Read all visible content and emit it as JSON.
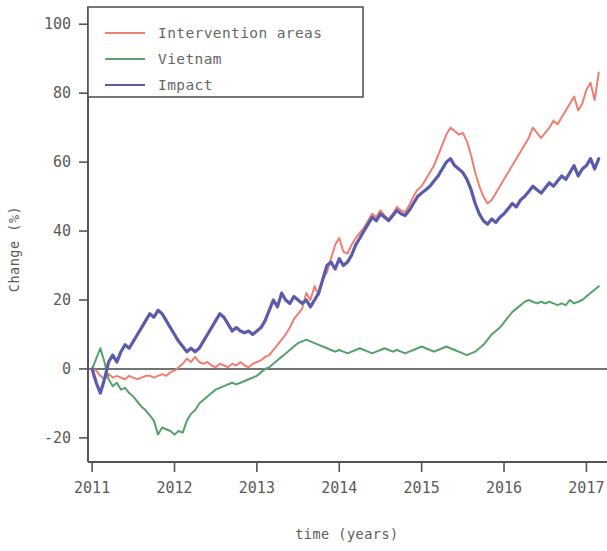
{
  "chart_data": {
    "type": "line",
    "title": "",
    "xlabel": "time (years)",
    "ylabel": "Change (%)",
    "xlim": [
      2010.95,
      2017.25
    ],
    "ylim": [
      -27,
      105
    ],
    "xticks": [
      2011,
      2012,
      2013,
      2014,
      2015,
      2016,
      2017
    ],
    "xtick_labels": [
      "2011",
      "2012",
      "2013",
      "2014",
      "2015",
      "2016",
      "2017"
    ],
    "yticks": [
      -20,
      0,
      20,
      40,
      60,
      80,
      100
    ],
    "ytick_labels": [
      "-20",
      "0",
      "20",
      "40",
      "60",
      "80",
      "100"
    ],
    "grid": false,
    "legend_position": "upper left",
    "zero_line": 0,
    "series": [
      {
        "name": "Intervention areas",
        "color": "#ee7f72",
        "linewidth": 2.0,
        "x": [
          2011.0,
          2011.05,
          2011.1,
          2011.15,
          2011.2,
          2011.25,
          2011.3,
          2011.35,
          2011.4,
          2011.45,
          2011.5,
          2011.55,
          2011.6,
          2011.65,
          2011.7,
          2011.75,
          2011.8,
          2011.85,
          2011.9,
          2011.95,
          2012.0,
          2012.05,
          2012.1,
          2012.15,
          2012.2,
          2012.25,
          2012.3,
          2012.35,
          2012.4,
          2012.45,
          2012.5,
          2012.55,
          2012.6,
          2012.65,
          2012.7,
          2012.75,
          2012.8,
          2012.85,
          2012.9,
          2012.95,
          2013.0,
          2013.05,
          2013.1,
          2013.15,
          2013.2,
          2013.25,
          2013.3,
          2013.35,
          2013.4,
          2013.45,
          2013.5,
          2013.55,
          2013.6,
          2013.65,
          2013.7,
          2013.75,
          2013.8,
          2013.85,
          2013.9,
          2013.95,
          2014.0,
          2014.05,
          2014.1,
          2014.15,
          2014.2,
          2014.25,
          2014.3,
          2014.35,
          2014.4,
          2014.45,
          2014.5,
          2014.55,
          2014.6,
          2014.65,
          2014.7,
          2014.75,
          2014.8,
          2014.85,
          2014.9,
          2014.95,
          2015.0,
          2015.05,
          2015.1,
          2015.15,
          2015.2,
          2015.25,
          2015.3,
          2015.35,
          2015.4,
          2015.45,
          2015.5,
          2015.55,
          2015.6,
          2015.65,
          2015.7,
          2015.75,
          2015.8,
          2015.85,
          2015.9,
          2015.95,
          2016.0,
          2016.05,
          2016.1,
          2016.15,
          2016.2,
          2016.25,
          2016.3,
          2016.35,
          2016.4,
          2016.45,
          2016.5,
          2016.55,
          2016.6,
          2016.65,
          2016.7,
          2016.75,
          2016.8,
          2016.85,
          2016.9,
          2016.95,
          2017.0,
          2017.05,
          2017.1,
          2017.15
        ],
        "y": [
          0.0,
          -0.5,
          -2.0,
          -3.0,
          -1.5,
          -2.5,
          -2.0,
          -2.5,
          -3.0,
          -2.0,
          -2.5,
          -3.0,
          -2.5,
          -2.0,
          -2.0,
          -2.5,
          -2.0,
          -1.5,
          -2.0,
          -1.0,
          -0.5,
          0.5,
          1.5,
          3.0,
          2.0,
          3.5,
          2.0,
          1.5,
          2.0,
          1.0,
          0.5,
          1.5,
          1.0,
          0.5,
          1.5,
          1.0,
          2.0,
          1.0,
          0.5,
          1.5,
          2.0,
          2.5,
          3.5,
          4.0,
          5.5,
          7.0,
          8.5,
          10.0,
          12.0,
          14.5,
          16.0,
          17.5,
          22.0,
          20.0,
          24.0,
          21.5,
          26.0,
          28.0,
          32.0,
          36.0,
          38.0,
          34.0,
          33.5,
          36.0,
          38.0,
          39.5,
          41.0,
          43.0,
          45.0,
          44.0,
          46.0,
          44.5,
          43.5,
          45.0,
          47.0,
          46.0,
          45.5,
          47.5,
          50.0,
          52.0,
          53.0,
          55.0,
          57.0,
          59.0,
          62.0,
          65.0,
          68.0,
          70.0,
          69.0,
          68.0,
          68.5,
          66.0,
          62.0,
          57.0,
          53.0,
          50.0,
          48.0,
          49.0,
          51.0,
          53.0,
          55.0,
          57.0,
          59.0,
          61.0,
          63.0,
          65.0,
          67.0,
          70.0,
          68.5,
          67.0,
          68.5,
          70.0,
          72.0,
          71.0,
          73.0,
          75.0,
          77.0,
          79.0,
          75.0,
          77.0,
          81.0,
          83.0,
          78.0,
          86.0
        ]
      },
      {
        "name": "Vietnam",
        "color": "#56a06a",
        "linewidth": 2.0,
        "x": [
          2011.0,
          2011.05,
          2011.1,
          2011.15,
          2011.2,
          2011.25,
          2011.3,
          2011.35,
          2011.4,
          2011.45,
          2011.5,
          2011.55,
          2011.6,
          2011.65,
          2011.7,
          2011.75,
          2011.8,
          2011.85,
          2011.9,
          2011.95,
          2012.0,
          2012.05,
          2012.1,
          2012.15,
          2012.2,
          2012.25,
          2012.3,
          2012.35,
          2012.4,
          2012.45,
          2012.5,
          2012.55,
          2012.6,
          2012.65,
          2012.7,
          2012.75,
          2012.8,
          2012.85,
          2012.9,
          2012.95,
          2013.0,
          2013.05,
          2013.1,
          2013.15,
          2013.2,
          2013.25,
          2013.3,
          2013.35,
          2013.4,
          2013.45,
          2013.5,
          2013.55,
          2013.6,
          2013.65,
          2013.7,
          2013.75,
          2013.8,
          2013.85,
          2013.9,
          2013.95,
          2014.0,
          2014.05,
          2014.1,
          2014.15,
          2014.2,
          2014.25,
          2014.3,
          2014.35,
          2014.4,
          2014.45,
          2014.5,
          2014.55,
          2014.6,
          2014.65,
          2014.7,
          2014.75,
          2014.8,
          2014.85,
          2014.9,
          2014.95,
          2015.0,
          2015.05,
          2015.1,
          2015.15,
          2015.2,
          2015.25,
          2015.3,
          2015.35,
          2015.4,
          2015.45,
          2015.5,
          2015.55,
          2015.6,
          2015.65,
          2015.7,
          2015.75,
          2015.8,
          2015.85,
          2015.9,
          2015.95,
          2016.0,
          2016.05,
          2016.1,
          2016.15,
          2016.2,
          2016.25,
          2016.3,
          2016.35,
          2016.4,
          2016.45,
          2016.5,
          2016.55,
          2016.6,
          2016.65,
          2016.7,
          2016.75,
          2016.8,
          2016.85,
          2016.9,
          2016.95,
          2017.0,
          2017.05,
          2017.1,
          2017.15
        ],
        "y": [
          0.0,
          3.0,
          6.0,
          2.0,
          -3.0,
          -5.0,
          -4.0,
          -6.0,
          -5.5,
          -7.0,
          -8.0,
          -9.5,
          -11.0,
          -12.0,
          -13.5,
          -15.0,
          -19.0,
          -17.0,
          -17.5,
          -18.0,
          -19.0,
          -18.0,
          -18.5,
          -15.0,
          -13.0,
          -12.0,
          -10.0,
          -9.0,
          -8.0,
          -7.0,
          -6.0,
          -5.5,
          -5.0,
          -4.5,
          -4.0,
          -4.5,
          -4.0,
          -3.5,
          -3.0,
          -2.5,
          -2.0,
          -1.0,
          0.0,
          0.5,
          1.5,
          2.5,
          3.5,
          4.5,
          5.5,
          6.5,
          7.5,
          8.0,
          8.5,
          8.0,
          7.5,
          7.0,
          6.5,
          6.0,
          5.5,
          5.0,
          5.5,
          5.0,
          4.5,
          5.0,
          5.5,
          6.0,
          5.5,
          5.0,
          4.5,
          5.0,
          5.5,
          6.0,
          5.5,
          5.0,
          5.5,
          5.0,
          4.5,
          5.0,
          5.5,
          6.0,
          6.5,
          6.0,
          5.5,
          5.0,
          5.5,
          6.0,
          6.5,
          6.0,
          5.5,
          5.0,
          4.5,
          4.0,
          4.5,
          5.0,
          6.0,
          7.0,
          8.5,
          10.0,
          11.0,
          12.0,
          13.5,
          15.0,
          16.5,
          17.5,
          18.5,
          19.5,
          20.0,
          19.5,
          19.0,
          19.5,
          19.0,
          19.5,
          19.0,
          18.5,
          19.0,
          18.5,
          20.0,
          19.0,
          19.5,
          20.0,
          21.0,
          22.0,
          23.0,
          24.0
        ]
      },
      {
        "name": "Impact",
        "color": "#5b5bae",
        "linewidth": 3.2,
        "x": [
          2011.0,
          2011.05,
          2011.1,
          2011.15,
          2011.2,
          2011.25,
          2011.3,
          2011.35,
          2011.4,
          2011.45,
          2011.5,
          2011.55,
          2011.6,
          2011.65,
          2011.7,
          2011.75,
          2011.8,
          2011.85,
          2011.9,
          2011.95,
          2012.0,
          2012.05,
          2012.1,
          2012.15,
          2012.2,
          2012.25,
          2012.3,
          2012.35,
          2012.4,
          2012.45,
          2012.5,
          2012.55,
          2012.6,
          2012.65,
          2012.7,
          2012.75,
          2012.8,
          2012.85,
          2012.9,
          2012.95,
          2013.0,
          2013.05,
          2013.1,
          2013.15,
          2013.2,
          2013.25,
          2013.3,
          2013.35,
          2013.4,
          2013.45,
          2013.5,
          2013.55,
          2013.6,
          2013.65,
          2013.7,
          2013.75,
          2013.8,
          2013.85,
          2013.9,
          2013.95,
          2014.0,
          2014.05,
          2014.1,
          2014.15,
          2014.2,
          2014.25,
          2014.3,
          2014.35,
          2014.4,
          2014.45,
          2014.5,
          2014.55,
          2014.6,
          2014.65,
          2014.7,
          2014.75,
          2014.8,
          2014.85,
          2014.9,
          2014.95,
          2015.0,
          2015.05,
          2015.1,
          2015.15,
          2015.2,
          2015.25,
          2015.3,
          2015.35,
          2015.4,
          2015.45,
          2015.5,
          2015.55,
          2015.6,
          2015.65,
          2015.7,
          2015.75,
          2015.8,
          2015.85,
          2015.9,
          2015.95,
          2016.0,
          2016.05,
          2016.1,
          2016.15,
          2016.2,
          2016.25,
          2016.3,
          2016.35,
          2016.4,
          2016.45,
          2016.5,
          2016.55,
          2016.6,
          2016.65,
          2016.7,
          2016.75,
          2016.8,
          2016.85,
          2016.9,
          2016.95,
          2017.0,
          2017.05,
          2017.1,
          2017.15
        ],
        "y": [
          0.0,
          -4.0,
          -7.0,
          -3.0,
          2.0,
          4.0,
          2.0,
          5.0,
          7.0,
          6.0,
          8.0,
          10.0,
          12.0,
          14.0,
          16.0,
          15.0,
          17.0,
          16.0,
          14.0,
          12.0,
          10.0,
          8.0,
          6.5,
          5.0,
          6.0,
          5.0,
          6.0,
          8.0,
          10.0,
          12.0,
          14.0,
          16.0,
          15.0,
          13.0,
          11.0,
          12.0,
          11.0,
          10.5,
          11.0,
          10.0,
          11.0,
          12.0,
          14.0,
          17.0,
          20.0,
          18.0,
          22.0,
          20.0,
          19.0,
          21.0,
          20.0,
          19.0,
          20.0,
          18.0,
          20.0,
          22.0,
          26.0,
          30.0,
          31.0,
          29.0,
          32.0,
          30.0,
          31.0,
          33.0,
          36.0,
          38.0,
          40.0,
          42.0,
          44.0,
          43.0,
          45.0,
          44.0,
          43.0,
          44.5,
          46.0,
          45.0,
          44.5,
          46.0,
          48.0,
          50.0,
          51.0,
          52.0,
          53.0,
          54.5,
          56.0,
          58.0,
          60.0,
          61.0,
          59.0,
          58.0,
          57.0,
          55.0,
          52.0,
          48.0,
          45.0,
          43.0,
          42.0,
          43.5,
          42.5,
          44.0,
          45.0,
          46.5,
          48.0,
          47.0,
          49.0,
          50.0,
          51.5,
          53.0,
          52.0,
          51.0,
          52.5,
          54.0,
          53.0,
          54.5,
          56.0,
          55.0,
          57.0,
          59.0,
          56.0,
          58.0,
          59.0,
          61.0,
          58.0,
          61.0
        ]
      }
    ]
  },
  "legend": {
    "entries": [
      {
        "label": "Intervention areas",
        "color": "#ee7f72"
      },
      {
        "label": "Vietnam",
        "color": "#56a06a"
      },
      {
        "label": "Impact",
        "color": "#5b5bae"
      }
    ]
  }
}
